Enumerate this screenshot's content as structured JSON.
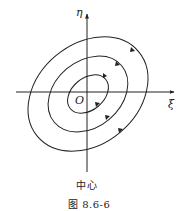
{
  "figure": {
    "axes": {
      "vertical_label": "η",
      "horizontal_label": "ξ",
      "origin_label": "O"
    },
    "subtitle": "中心",
    "caption": "图 8.6-6",
    "orbits": [
      {
        "name": "inner",
        "direction": "clockwise"
      },
      {
        "name": "middle",
        "direction": "clockwise"
      },
      {
        "name": "outer",
        "direction": "clockwise"
      }
    ],
    "colors": {
      "stroke": "#222222",
      "background": "#ffffff"
    }
  }
}
